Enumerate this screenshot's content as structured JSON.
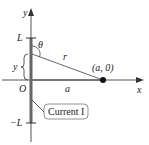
{
  "diagram": {
    "axes": {
      "x_label": "x",
      "y_label": "y",
      "origin_label": "O"
    },
    "ticks": {
      "top": "L",
      "bottom": "−L"
    },
    "labels": {
      "theta": "θ",
      "r": "r",
      "a": "a",
      "y_segment": "y",
      "point": "(a, 0)",
      "callout": "Current I"
    },
    "colors": {
      "axis": "#555555",
      "wire": "#666666",
      "point": "#111111",
      "text": "#222222"
    }
  }
}
